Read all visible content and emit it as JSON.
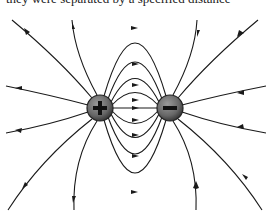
{
  "diagram": {
    "caption_partial": "they were separated by a specified distance",
    "charges": [
      {
        "name": "positive-charge",
        "sign": "+",
        "cx": 100,
        "cy": 108,
        "r": 13,
        "color": "#6e6e6e"
      },
      {
        "name": "negative-charge",
        "sign": "-",
        "cx": 170,
        "cy": 108,
        "r": 13,
        "color": "#6e6e6e"
      }
    ],
    "line_color": "#1a1a1a",
    "direction": "from positive charge to negative charge"
  }
}
